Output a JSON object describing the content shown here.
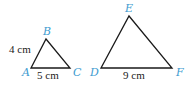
{
  "triangles": [
    {
      "name": "ABC",
      "vertices": [
        {
          "label": "A",
          "x": 31,
          "y": 68
        },
        {
          "label": "B",
          "x": 46,
          "y": 39
        },
        {
          "label": "C",
          "x": 70,
          "y": 68
        }
      ],
      "measurements": {
        "AB": "4 cm",
        "AC": "5 cm"
      }
    },
    {
      "name": "DEF",
      "vertices": [
        {
          "label": "D",
          "x": 101,
          "y": 68
        },
        {
          "label": "E",
          "x": 129,
          "y": 16
        },
        {
          "label": "F",
          "x": 172,
          "y": 68
        }
      ],
      "measurements": {
        "DF": "9 cm"
      }
    }
  ],
  "colors": {
    "vertex_label": "#3d9bd0",
    "edge": "#1a1a1a",
    "text": "#222222"
  }
}
